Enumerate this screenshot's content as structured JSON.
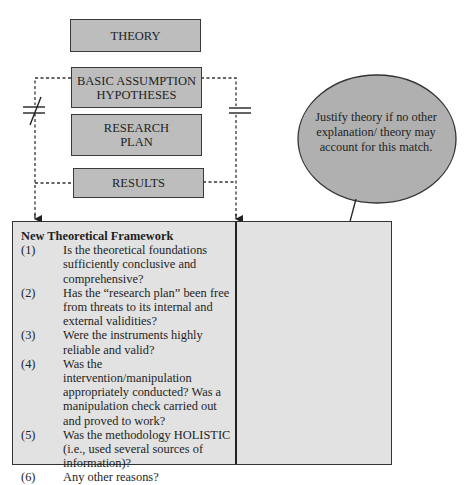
{
  "flow_boxes": {
    "theory": "THEORY",
    "assumption_line1": "BASIC ASSUMPTION",
    "assumption_line2": "HYPOTHESES",
    "plan_line1": "RESEARCH",
    "plan_line2": "PLAN",
    "results": "RESULTS"
  },
  "symbols": {
    "left": "not-equal",
    "right": "equal"
  },
  "bubble": {
    "text": "Justify theory if no other explanation/ theory may account for this match."
  },
  "framework": {
    "title": "New Theoretical Framework",
    "items": [
      {
        "num": "(1)",
        "text": "Is the theoretical foundations sufficiently conclusive and comprehensive?"
      },
      {
        "num": "(2)",
        "text": "Has the “research plan” been free from threats to its internal and external validities?"
      },
      {
        "num": "(3)",
        "text": "Were the instruments highly reliable and valid?"
      },
      {
        "num": "(4)",
        "text": "Was the intervention/manipulation appropriately conducted?  Was a manipulation check carried out and proved to work?"
      },
      {
        "num": "(5)",
        "text": "Was the methodology HOLISTIC (i.e., used several sources of information)?"
      },
      {
        "num": "(6)",
        "text": "Any other reasons?"
      }
    ]
  },
  "colors": {
    "box_fill": "#bdbdbd",
    "panel_fill": "#e2e2e2",
    "bubble_fill": "#b0b0b0",
    "stroke": "#333333"
  }
}
